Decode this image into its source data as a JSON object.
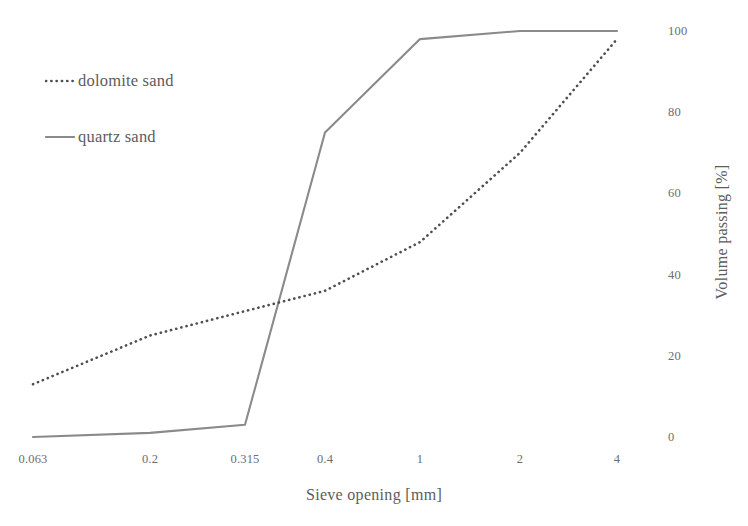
{
  "chart_data": {
    "type": "line",
    "title": "",
    "xlabel": "Sieve opening [mm]",
    "ylabel": "Volume passing [%]",
    "categories": [
      "0.063",
      "0.2",
      "0.315",
      "0.4",
      "1",
      "2",
      "4"
    ],
    "x_tick_labels": [
      "0.063",
      "0.2",
      "0.315",
      "0.4",
      "1",
      "2",
      "4"
    ],
    "y_tick_labels": [
      "0",
      "20",
      "40",
      "60",
      "80",
      "100"
    ],
    "y_tick_values": [
      0,
      20,
      40,
      60,
      80,
      100
    ],
    "ylim": [
      0,
      100
    ],
    "grid": false,
    "legend_position": "upper-left",
    "y_axis_side": "right",
    "series": [
      {
        "name": "dolomite sand",
        "style": "dotted",
        "color": "#4f4f52",
        "values": [
          13,
          25,
          31,
          36,
          48,
          70,
          98
        ]
      },
      {
        "name": "quartz sand",
        "style": "solid",
        "color": "#8a8a8d",
        "values": [
          0,
          1,
          3,
          75,
          98,
          100,
          100
        ]
      }
    ]
  },
  "legend": {
    "items": [
      {
        "label": "dolomite sand",
        "style": "dotted",
        "color": "#4f4f52"
      },
      {
        "label": "quartz sand",
        "style": "solid",
        "color": "#8a8a8d"
      }
    ]
  },
  "axes": {
    "x_title": "Sieve opening [mm]",
    "y_title": "Volume passing [%]"
  }
}
